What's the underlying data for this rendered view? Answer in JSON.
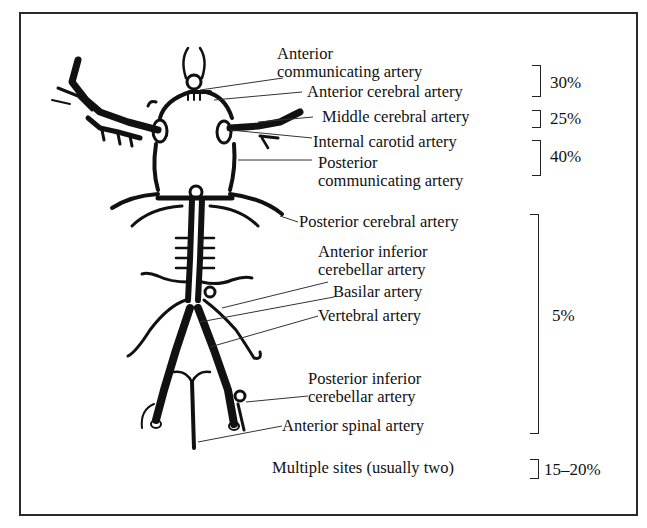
{
  "figure": {
    "type": "anatomical diagram",
    "labels": [
      {
        "id": "acom",
        "lines": [
          "Anterior",
          "communicating artery"
        ]
      },
      {
        "id": "aca",
        "lines": [
          "Anterior cerebral artery"
        ]
      },
      {
        "id": "mca",
        "lines": [
          "Middle cerebral artery"
        ]
      },
      {
        "id": "ica",
        "lines": [
          "Internal carotid artery"
        ]
      },
      {
        "id": "pcom",
        "lines": [
          "Posterior",
          "communicating artery"
        ]
      },
      {
        "id": "pca",
        "lines": [
          "Posterior cerebral artery"
        ]
      },
      {
        "id": "aica",
        "lines": [
          "Anterior inferior",
          "cerebellar artery"
        ]
      },
      {
        "id": "basilar",
        "lines": [
          "Basilar artery"
        ]
      },
      {
        "id": "vertebral",
        "lines": [
          "Vertebral artery"
        ]
      },
      {
        "id": "pica",
        "lines": [
          "Posterior inferior",
          "cerebellar artery"
        ]
      },
      {
        "id": "asa",
        "lines": [
          "Anterior spinal artery"
        ]
      },
      {
        "id": "multiple",
        "lines": [
          "Multiple sites (usually two)"
        ]
      }
    ],
    "percentages": [
      {
        "group": "anterior communicating / anterior cerebral",
        "value": "30%"
      },
      {
        "group": "middle cerebral",
        "value": "25%"
      },
      {
        "group": "internal carotid / posterior communicating",
        "value": "40%"
      },
      {
        "group": "posterior circulation (vertebrobasilar)",
        "value": "5%"
      },
      {
        "group": "multiple sites",
        "value": "15–20%"
      }
    ]
  },
  "colors": {
    "ink": "#111111",
    "frame": "#2a2a2a",
    "background": "#ffffff"
  }
}
